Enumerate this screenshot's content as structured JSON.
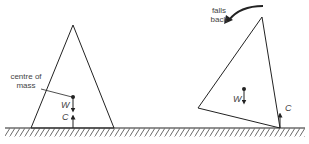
{
  "diagram": {
    "left_figure": {
      "label_centre_of_mass": "centre of mass",
      "label_centre_line1": "centre of",
      "label_centre_line2": "mass",
      "force_weight": "W",
      "force_contact": "C"
    },
    "right_figure": {
      "label_falls_line1": "falls",
      "label_falls_line2": "back",
      "force_weight": "W",
      "force_contact": "C"
    },
    "colors": {
      "line": "#222222",
      "text": "#444444",
      "background": "#ffffff"
    }
  }
}
